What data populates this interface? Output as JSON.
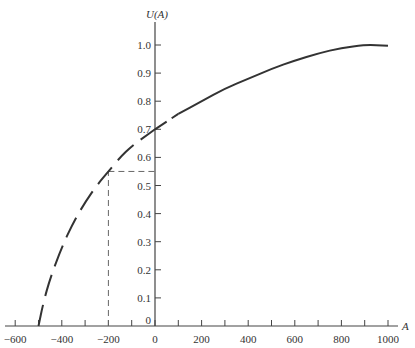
{
  "chart_data": {
    "type": "line",
    "title": "",
    "xlabel": "A",
    "ylabel": "U(A)",
    "xlim": [
      -640,
      1060
    ],
    "ylim": [
      0,
      1.1
    ],
    "grid": false,
    "legend": null,
    "x_ticks": [
      -600,
      -500,
      -400,
      -300,
      -200,
      -100,
      0,
      100,
      200,
      300,
      400,
      500,
      600,
      700,
      800,
      900,
      1000
    ],
    "x_tick_labels": [
      "−600",
      "−400",
      "−200",
      "0",
      "200",
      "400",
      "600",
      "800",
      "1000"
    ],
    "x_tick_label_values": [
      -600,
      -400,
      -200,
      0,
      200,
      400,
      600,
      800,
      1000
    ],
    "y_ticks": [
      0,
      0.1,
      0.2,
      0.3,
      0.4,
      0.5,
      0.6,
      0.7,
      0.8,
      0.9,
      1.0
    ],
    "y_tick_labels": [
      "0",
      "0.1",
      "0.2",
      "0.3",
      "0.4",
      "0.5",
      "0.6",
      "0.7",
      "0.8",
      "0.9",
      "1.0"
    ],
    "series": [
      {
        "name": "U(A)",
        "x": [
          -500,
          -480,
          -450,
          -400,
          -350,
          -300,
          -250,
          -200,
          -150,
          -100,
          -50,
          0,
          100,
          200,
          300,
          400,
          500,
          600,
          700,
          800,
          900,
          950,
          1000
        ],
        "y": [
          0,
          0.08,
          0.17,
          0.28,
          0.37,
          0.44,
          0.5,
          0.55,
          0.6,
          0.64,
          0.67,
          0.7,
          0.755,
          0.8,
          0.845,
          0.88,
          0.915,
          0.945,
          0.97,
          0.99,
          1.0,
          1.0,
          0.997
        ],
        "style_segments": [
          {
            "from": -500,
            "to": 0,
            "style": "long-dash"
          },
          {
            "from": 0,
            "to": 100,
            "style": "dash"
          },
          {
            "from": 100,
            "to": 1000,
            "style": "solid"
          }
        ]
      }
    ],
    "annotations": [
      {
        "type": "dashed-guide",
        "description": "vertical from (-200, 0) to (-200, 0.55)",
        "x": -200,
        "y": 0.55
      },
      {
        "type": "dashed-guide",
        "description": "horizontal from (-200, 0.55) to (0, 0.55)",
        "x": -200,
        "y": 0.55
      }
    ]
  },
  "labels": {
    "y_axis_title": "U(A)",
    "x_axis_title": "A"
  }
}
